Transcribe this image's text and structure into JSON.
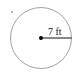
{
  "diagram": {
    "shape": "circle",
    "radius_label": "7 ft",
    "colors": {
      "stroke": "#8a8a8a",
      "radius_line": "#111111",
      "center_dot": "#000000",
      "text": "#222222"
    }
  }
}
